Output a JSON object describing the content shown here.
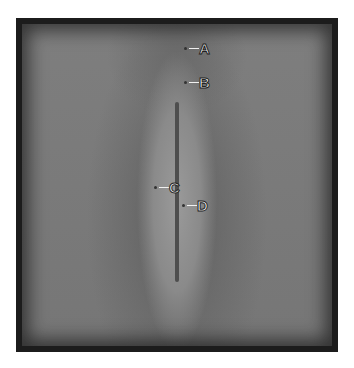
{
  "figure": {
    "labels": [
      {
        "id": "A",
        "text": "A"
      },
      {
        "id": "B",
        "text": "B"
      },
      {
        "id": "C",
        "text": "C"
      },
      {
        "id": "D",
        "text": "D"
      }
    ]
  }
}
